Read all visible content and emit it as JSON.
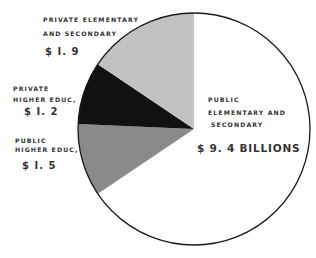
{
  "chart_data": {
    "type": "pie",
    "title": "",
    "unit": "Billions of dollars",
    "categories": [
      "Public Elementary and Secondary",
      "Public Higher Educ.",
      "Private Higher Educ.",
      "Private Elementary and Secondary"
    ],
    "values": [
      9.4,
      1.5,
      1.2,
      1.9
    ],
    "colors": [
      "#ffffff",
      "#8a8a8a",
      "#111111",
      "#c2c2c2"
    ],
    "drawn_boundaries_deg_clockwise_from_top": [
      0,
      236,
      272.5,
      304,
      360
    ],
    "legend": "none (direct labels)"
  },
  "labels": {
    "public_elem": {
      "line1": "PUBLIC",
      "line2": "ELEMENTARY  AND",
      "line3": "SECONDARY",
      "value": "$ 9. 4  BILLIONS"
    },
    "public_higher": {
      "line1": "PUBLIC",
      "line2": "HIGHER EDUC,",
      "value": "$ I. 5"
    },
    "private_higher": {
      "line1": "PRIVATE",
      "line2": "HIGHER EDUC,",
      "value": "$ I. 2"
    },
    "private_elem": {
      "line1": "PRIVATE ELEMENTARY",
      "line2": "AND SECONDARY",
      "value": "$ I. 9"
    }
  }
}
